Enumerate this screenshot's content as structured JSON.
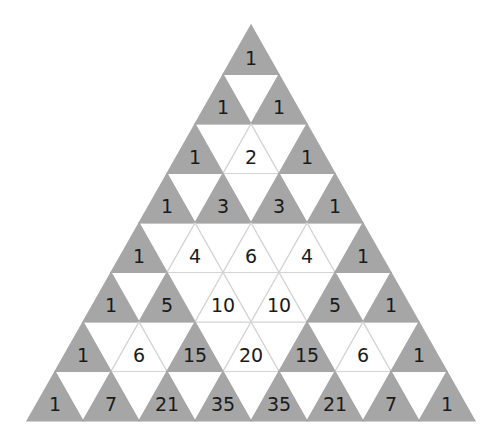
{
  "diagram": {
    "rows": [
      [
        1
      ],
      [
        1,
        1
      ],
      [
        1,
        2,
        1
      ],
      [
        1,
        3,
        3,
        1
      ],
      [
        1,
        4,
        6,
        4,
        1
      ],
      [
        1,
        5,
        10,
        10,
        5,
        1
      ],
      [
        1,
        6,
        15,
        20,
        15,
        6,
        1
      ],
      [
        1,
        7,
        21,
        35,
        35,
        21,
        7,
        1
      ]
    ],
    "colors": {
      "odd_fill": "#a6a6a6",
      "even_fill": "#ffffff",
      "edge": "#d4d4d4",
      "text": "#1a1a1a"
    }
  }
}
